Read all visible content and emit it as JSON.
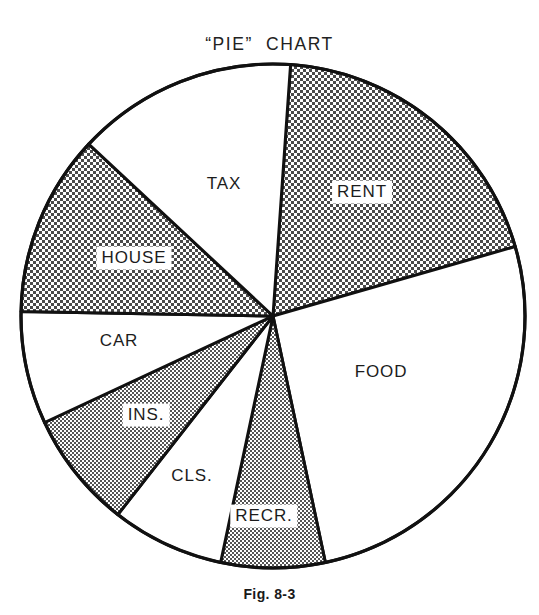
{
  "figure": {
    "title": "“PIE”  CHART",
    "caption": "Fig. 8-3"
  },
  "chart_data": {
    "type": "pie",
    "title": "“PIE” CHART",
    "caption": "Fig. 8-3",
    "legend": "none",
    "labels_inside_slices": true,
    "center": {
      "x": 273,
      "y": 316
    },
    "radius": 252,
    "start_angle_deg": 4,
    "direction": "clockwise",
    "outline_color": "#111111",
    "fill_white": "#ffffff",
    "fill_shaded": "#b9b9b9",
    "categories": [
      "RENT",
      "FOOD",
      "RECR.",
      "CLS.",
      "INS.",
      "CAR",
      "HOUSE",
      "TAX"
    ],
    "values": [
      19.4,
      26.1,
      6.7,
      7.2,
      7.5,
      7.2,
      11.7,
      14.2
    ],
    "slices": [
      {
        "label": "RENT",
        "start_deg": 4,
        "end_deg": 74,
        "sweep_deg": 70,
        "percent": 19.4,
        "shaded": true,
        "label_boxed": true,
        "label_x": 362,
        "label_y": 192
      },
      {
        "label": "FOOD",
        "start_deg": 74,
        "end_deg": 168,
        "sweep_deg": 94,
        "percent": 26.1,
        "shaded": false,
        "label_boxed": false,
        "label_x": 381,
        "label_y": 372
      },
      {
        "label": "RECR.",
        "start_deg": 168,
        "end_deg": 192,
        "sweep_deg": 24,
        "percent": 6.7,
        "shaded": true,
        "label_boxed": true,
        "label_x": 264,
        "label_y": 516
      },
      {
        "label": "CLS.",
        "start_deg": 192,
        "end_deg": 218,
        "sweep_deg": 26,
        "percent": 7.2,
        "shaded": false,
        "label_boxed": false,
        "label_x": 192,
        "label_y": 476
      },
      {
        "label": "INS.",
        "start_deg": 218,
        "end_deg": 245,
        "sweep_deg": 27,
        "percent": 7.5,
        "shaded": true,
        "label_boxed": true,
        "label_x": 146,
        "label_y": 415
      },
      {
        "label": "CAR",
        "start_deg": 245,
        "end_deg": 271,
        "sweep_deg": 26,
        "percent": 7.2,
        "shaded": false,
        "label_boxed": false,
        "label_x": 119,
        "label_y": 341
      },
      {
        "label": "HOUSE",
        "start_deg": 271,
        "end_deg": 313,
        "sweep_deg": 42,
        "percent": 11.7,
        "shaded": true,
        "label_boxed": true,
        "label_x": 134,
        "label_y": 258
      },
      {
        "label": "TAX",
        "start_deg": 313,
        "end_deg": 364,
        "sweep_deg": 51,
        "percent": 14.2,
        "shaded": false,
        "label_boxed": false,
        "label_x": 224,
        "label_y": 184
      }
    ],
    "xlabel": "",
    "ylabel": ""
  }
}
